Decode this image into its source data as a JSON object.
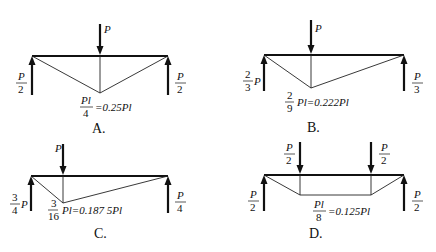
{
  "panels": [
    {
      "id": "A",
      "caption": "A.",
      "load": {
        "label": "P"
      },
      "left_reaction": {
        "num": "P",
        "den": "2"
      },
      "right_reaction": {
        "num": "P",
        "den": "2"
      },
      "max_moment": {
        "num": "Pl",
        "den": "4",
        "value": "=0.25Pl"
      }
    },
    {
      "id": "B",
      "caption": "B.",
      "load": {
        "label": "P"
      },
      "left_reaction": {
        "num": "2",
        "den": "3",
        "suffix": "P"
      },
      "right_reaction": {
        "num": "P",
        "den": "3"
      },
      "max_moment": {
        "num": "2",
        "den": "9",
        "value": "Pl=0.222Pl"
      }
    },
    {
      "id": "C",
      "caption": "C.",
      "load": {
        "label": "P"
      },
      "left_reaction": {
        "num": "3",
        "den": "4",
        "suffix": "P"
      },
      "right_reaction": {
        "num": "P",
        "den": "4"
      },
      "max_moment": {
        "num": "3",
        "den": "16",
        "value": "Pl=0.187 5Pl"
      }
    },
    {
      "id": "D",
      "caption": "D.",
      "load_left": {
        "num": "P",
        "den": "2"
      },
      "load_right": {
        "num": "P",
        "den": "2"
      },
      "left_reaction": {
        "num": "P",
        "den": "2"
      },
      "right_reaction": {
        "num": "P",
        "den": "2"
      },
      "max_moment": {
        "num": "Pl",
        "den": "8",
        "value": "=0.125Pl"
      }
    }
  ]
}
